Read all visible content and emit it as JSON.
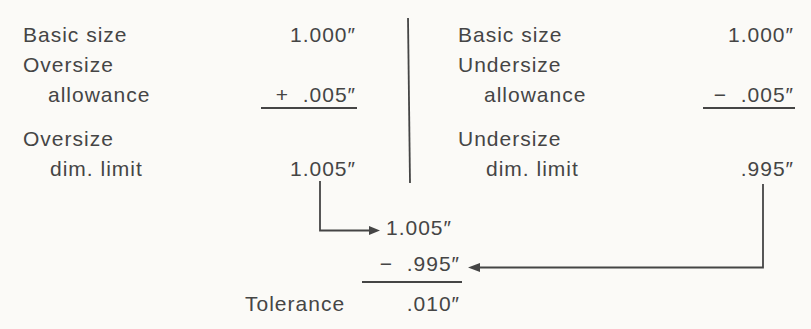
{
  "palette": {
    "background": "#fbfaf7",
    "ink": "#454545"
  },
  "left_block": {
    "basic_size_label": "Basic size",
    "basic_size_value": "1.000″",
    "allowance_label_line1": "Oversize",
    "allowance_label_line2": "allowance",
    "allowance_value": "+  .005″",
    "limit_label_line1": "Oversize",
    "limit_label_line2": "dim. limit",
    "limit_value": "1.005″"
  },
  "right_block": {
    "basic_size_label": "Basic size",
    "basic_size_value": "1.000″",
    "allowance_label_line1": "Undersize",
    "allowance_label_line2": "allowance",
    "allowance_value": "−  .005″",
    "limit_label_line1": "Undersize",
    "limit_label_line2": "dim. limit",
    "limit_value": ".995″"
  },
  "tolerance_block": {
    "minuend": "1.005″",
    "subtrahend": "−  .995″",
    "label": "Tolerance",
    "result": ".010″"
  }
}
